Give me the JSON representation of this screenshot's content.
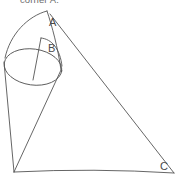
{
  "caption": {
    "text": "corner A."
  },
  "figure": {
    "background_color": "#ffffff",
    "stroke_color": "#555555",
    "label_color": "#4a4a4a",
    "vertex_labels": [
      {
        "id": "A",
        "text": "A",
        "x": 49,
        "y": 26
      },
      {
        "id": "B",
        "text": "B",
        "x": 48,
        "y": 52
      },
      {
        "id": "C",
        "text": "C",
        "x": 160,
        "y": 170
      }
    ],
    "points": {
      "apex_A": {
        "x": 47,
        "y": 11
      },
      "apex_B": {
        "x": 41,
        "y": 38
      },
      "bottom_left": {
        "x": 14,
        "y": 172
      },
      "bottom_right": {
        "x": 174,
        "y": 173
      },
      "ellipse_left": {
        "x": 4,
        "y": 62
      },
      "ellipse_right": {
        "x": 62,
        "y": 72
      }
    },
    "ellipse": {
      "center_x": 33,
      "center_y": 67,
      "radius_x": 29,
      "radius_y": 18,
      "rotation_deg": 8
    },
    "elements": [
      "outer-cone-curve",
      "inner-cone-curve",
      "ellipse-base",
      "triangle-right-edge",
      "triangle-bottom-edge",
      "triangle-left-edge",
      "cone-left-slant",
      "cone-right-slant",
      "chord-line"
    ]
  }
}
